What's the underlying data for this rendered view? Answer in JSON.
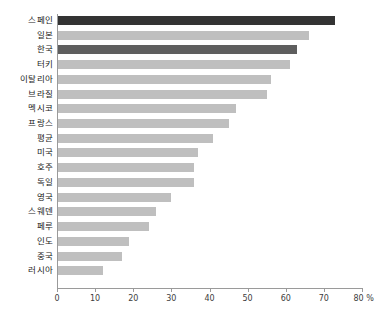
{
  "chart_data": {
    "type": "bar",
    "orientation": "horizontal",
    "title": "",
    "subtitle": "",
    "xlabel": "",
    "ylabel": "",
    "xlim": [
      0,
      80
    ],
    "xunit": "%",
    "grid": false,
    "legend": "none",
    "axis_tick_labels": [
      "0",
      "10",
      "20",
      "30",
      "40",
      "50",
      "60",
      "70",
      "80 %"
    ],
    "axis_ticks": [
      0,
      10,
      20,
      30,
      40,
      50,
      60,
      70,
      80
    ],
    "colors": {
      "default_bar": "#bfbfbf",
      "accent_dark": "#333333",
      "accent_medium": "#5e5e5e",
      "axis": "#9a9a9a",
      "text": "#1a1a1a"
    },
    "categories": [
      "스페인",
      "일본",
      "한국",
      "터키",
      "이탈리아",
      "브라질",
      "멕시코",
      "프랑스",
      "평균",
      "미국",
      "호주",
      "독일",
      "영국",
      "스웨덴",
      "페루",
      "인도",
      "중국",
      "러시아"
    ],
    "values": [
      73,
      66,
      63,
      61,
      56,
      55,
      47,
      45,
      41,
      37,
      36,
      36,
      30,
      26,
      24,
      19,
      17,
      12
    ],
    "bar_styles": [
      "accent-dark",
      "",
      "accent-medium",
      "",
      "",
      "",
      "",
      "",
      "",
      "",
      "",
      "",
      "",
      "",
      "",
      "",
      "",
      ""
    ],
    "bars": [
      {
        "label": "스페인",
        "value": 73,
        "style": "accent-dark"
      },
      {
        "label": "일본",
        "value": 66,
        "style": ""
      },
      {
        "label": "한국",
        "value": 63,
        "style": "accent-medium"
      },
      {
        "label": "터키",
        "value": 61,
        "style": ""
      },
      {
        "label": "이탈리아",
        "value": 56,
        "style": ""
      },
      {
        "label": "브라질",
        "value": 55,
        "style": ""
      },
      {
        "label": "멕시코",
        "value": 47,
        "style": ""
      },
      {
        "label": "프랑스",
        "value": 45,
        "style": ""
      },
      {
        "label": "평균",
        "value": 41,
        "style": ""
      },
      {
        "label": "미국",
        "value": 37,
        "style": ""
      },
      {
        "label": "호주",
        "value": 36,
        "style": ""
      },
      {
        "label": "독일",
        "value": 36,
        "style": ""
      },
      {
        "label": "영국",
        "value": 30,
        "style": ""
      },
      {
        "label": "스웨덴",
        "value": 26,
        "style": ""
      },
      {
        "label": "페루",
        "value": 24,
        "style": ""
      },
      {
        "label": "인도",
        "value": 19,
        "style": ""
      },
      {
        "label": "중국",
        "value": 17,
        "style": ""
      },
      {
        "label": "러시아",
        "value": 12,
        "style": ""
      }
    ]
  }
}
